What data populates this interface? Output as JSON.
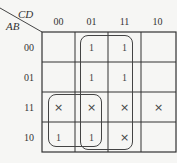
{
  "kmap": {
    "column_variables": "CD",
    "row_variables": "AB",
    "column_headers": [
      "00",
      "01",
      "11",
      "10"
    ],
    "row_headers": [
      "00",
      "01",
      "11",
      "10"
    ],
    "cells": [
      [
        "",
        "1",
        "1",
        ""
      ],
      [
        "",
        "1",
        "1",
        ""
      ],
      [
        "×",
        "×",
        "×",
        "×"
      ],
      [
        "1",
        "1",
        "×",
        ""
      ]
    ],
    "groups": [
      {
        "name": "group-cols-01-11-all-rows",
        "rows": [
          "00",
          "01",
          "11",
          "10"
        ],
        "cols": [
          "01",
          "11"
        ]
      },
      {
        "name": "group-rows-11-10-cols-00-01",
        "rows": [
          "11",
          "10"
        ],
        "cols": [
          "00",
          "01"
        ]
      }
    ],
    "line_color": "#333333"
  }
}
